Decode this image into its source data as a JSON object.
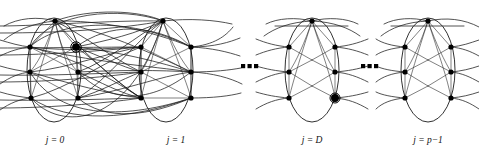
{
  "figure": {
    "canvas": {
      "width": 479,
      "height": 158
    },
    "background_color": "#ffffff",
    "edge_color": "#1a1a1a",
    "node_color": "#000000",
    "label_color": "#111111",
    "ellipsis_glyph": "▬▬▬",
    "ellipsis_text": "· · ·",
    "clusters": [
      {
        "id": "cluster-j0",
        "label": "j = 0",
        "label_x": 55,
        "label_y": 143,
        "center_x": 54,
        "center_y": 70,
        "rx": 27,
        "ry": 52,
        "nodes": [
          {
            "id": "j0-top",
            "x": 55,
            "y": 21,
            "marked": false
          },
          {
            "id": "j0-l1",
            "x": 30,
            "y": 47,
            "marked": false
          },
          {
            "id": "j0-l2",
            "x": 30,
            "y": 72,
            "marked": false
          },
          {
            "id": "j0-l3",
            "x": 31,
            "y": 98,
            "marked": false
          },
          {
            "id": "j0-r1",
            "x": 76,
            "y": 47,
            "marked": true
          },
          {
            "id": "j0-r2",
            "x": 78,
            "y": 72,
            "marked": false
          },
          {
            "id": "j0-r3",
            "x": 78,
            "y": 98,
            "marked": false
          }
        ]
      },
      {
        "id": "cluster-j1",
        "label": "j = 1",
        "label_x": 176,
        "label_y": 143,
        "center_x": 175,
        "center_y": 70,
        "rx": 27,
        "ry": 52,
        "nodes": [
          {
            "id": "j1-top",
            "x": 163,
            "y": 21,
            "marked": false
          },
          {
            "id": "j1-l1",
            "x": 141,
            "y": 47,
            "marked": false
          },
          {
            "id": "j1-l2",
            "x": 141,
            "y": 72,
            "marked": false
          },
          {
            "id": "j1-l3",
            "x": 141,
            "y": 98,
            "marked": false
          },
          {
            "id": "j1-r1",
            "x": 191,
            "y": 47,
            "marked": false
          },
          {
            "id": "j1-r2",
            "x": 191,
            "y": 72,
            "marked": false
          },
          {
            "id": "j1-r3",
            "x": 191,
            "y": 98,
            "marked": false
          }
        ]
      },
      {
        "id": "cluster-jD",
        "label": "j = D",
        "label_x": 312,
        "label_y": 143,
        "center_x": 312,
        "center_y": 70,
        "rx": 27,
        "ry": 52,
        "nodes": [
          {
            "id": "jD-top",
            "x": 312,
            "y": 21,
            "marked": false
          },
          {
            "id": "jD-l1",
            "x": 289,
            "y": 47,
            "marked": false
          },
          {
            "id": "jD-l2",
            "x": 289,
            "y": 72,
            "marked": false
          },
          {
            "id": "jD-l3",
            "x": 289,
            "y": 98,
            "marked": false
          },
          {
            "id": "jD-r1",
            "x": 335,
            "y": 47,
            "marked": false
          },
          {
            "id": "jD-r2",
            "x": 335,
            "y": 72,
            "marked": false
          },
          {
            "id": "jD-r3",
            "x": 335,
            "y": 98,
            "marked": true
          }
        ]
      },
      {
        "id": "cluster-jp1",
        "label": "j = p−1",
        "label_x": 428,
        "label_y": 143,
        "center_x": 428,
        "center_y": 70,
        "rx": 27,
        "ry": 52,
        "nodes": [
          {
            "id": "jp-top",
            "x": 428,
            "y": 21,
            "marked": false
          },
          {
            "id": "jp-l1",
            "x": 405,
            "y": 47,
            "marked": false
          },
          {
            "id": "jp-l2",
            "x": 405,
            "y": 72,
            "marked": false
          },
          {
            "id": "jp-l3",
            "x": 405,
            "y": 98,
            "marked": false
          },
          {
            "id": "jp-r1",
            "x": 451,
            "y": 47,
            "marked": false
          },
          {
            "id": "jp-r2",
            "x": 451,
            "y": 72,
            "marked": false
          },
          {
            "id": "jp-r3",
            "x": 451,
            "y": 98,
            "marked": false
          }
        ]
      }
    ],
    "ellipses_separators": [
      {
        "id": "ellipsis-1",
        "x": 249,
        "y": 70,
        "text": "· · ·"
      },
      {
        "id": "ellipsis-2",
        "x": 370,
        "y": 70,
        "text": "· · ·"
      }
    ]
  }
}
